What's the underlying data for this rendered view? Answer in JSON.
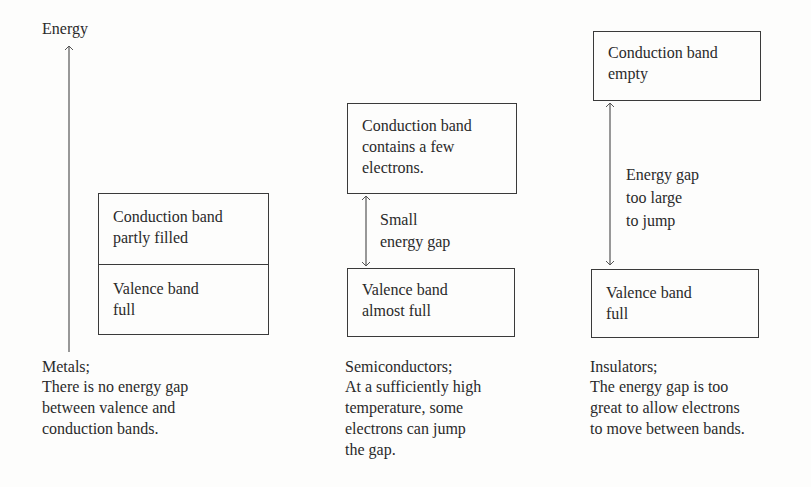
{
  "axis": {
    "label": "Energy"
  },
  "metals": {
    "conduction_band": "Conduction band\npartly filled",
    "valence_band": "Valence band\nfull",
    "caption_title": "Metals;",
    "caption_body": "There is no energy gap\nbetween valence and\nconduction bands."
  },
  "semiconductors": {
    "conduction_band": "Conduction band\ncontains a few\nelectrons.",
    "gap_label": "Small\nenergy gap",
    "valence_band": "Valence band\nalmost full",
    "caption_title": "Semiconductors;",
    "caption_body": "At a sufficiently high\ntemperature, some\nelectrons can jump\nthe gap."
  },
  "insulators": {
    "conduction_band": "Conduction band\nempty",
    "gap_label": "Energy gap\ntoo large\nto jump",
    "valence_band": "Valence band\nfull",
    "caption_title": "Insulators;",
    "caption_body": "The energy gap is too\ngreat to allow electrons\nto move between bands."
  },
  "colors": {
    "line": "#3a3a3a",
    "text": "#2a2a2a",
    "background": "#fdfdfc"
  }
}
